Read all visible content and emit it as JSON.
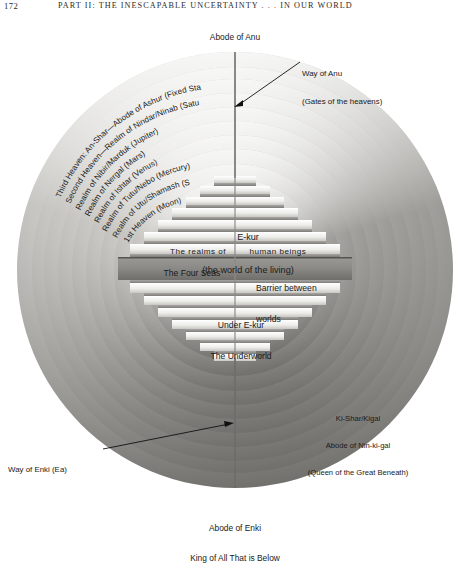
{
  "page": {
    "folio": "172",
    "running_head": "PART II: THE INESCAPABLE UNCERTAINTY . . . IN OUR WORLD"
  },
  "diagram": {
    "title_top": "Abode of Anu",
    "title_bottom_line1": "Abode of Enki",
    "title_bottom_line2": "King of All That is Below",
    "callouts": [
      {
        "id": "way-of-anu",
        "line1": "Way of Anu",
        "line2": "(Gates of the heavens)"
      },
      {
        "id": "way-of-enki",
        "line1": "Way of Enki (Ea)",
        "line2": ""
      }
    ],
    "kigal": {
      "line1": "Ki-Shar/Kigal",
      "line2": "Abode of Nin-ki-gal",
      "line3": "(Queen of the Great Beneath)"
    },
    "heaven_rings": [
      "Third Heaven: An-Shar—Abode of Ashur (Fixed Stars)",
      "Second Heaven—Realm of Nindar/Ninab (Saturn)",
      "Realm of Nibir/Marduk (Jupiter)",
      "Realm of Nergal (Mars)",
      "Realm of Ishtar (Venus)",
      "Realm of Tutu/Nebo (Mercury)",
      "Realm of Utu/Shamash (Sun)",
      "1st Heaven (Moon)"
    ],
    "core_labels": {
      "ekur_line1": "E-kur",
      "ekur_line2": "(the world of the living)",
      "realms_left": "The realms of",
      "realms_right": "human beings",
      "four_seas": "The Four Seas",
      "barrier_line1": "Barrier between",
      "barrier_line2": "worlds",
      "under_line1": "Under E-kur",
      "under_line2": "The Underworld"
    },
    "colors": {
      "ring_light": "#f2f1ee",
      "ring_mid": "#b9b8b4",
      "ring_dark": "#8d8c88",
      "step_light": "#fbfbf9",
      "step_shadow": "#9a9995",
      "ink": "#1a1a1a",
      "paper": "#ffffff"
    },
    "geometry": {
      "center_x": 235,
      "center_y": 270,
      "outer_radius": 218,
      "ring_count": 11
    }
  }
}
